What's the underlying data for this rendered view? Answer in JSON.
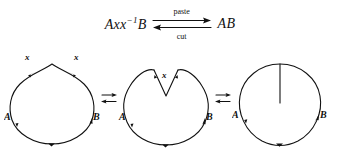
{
  "figure": {
    "caption_formula": {
      "left_expression": "Axx",
      "left_exponent": "−1",
      "left_tail": "B",
      "right_expression": "AB",
      "arrow_top_label": "paste",
      "arrow_bottom_label": "cut",
      "arrow_icon_top": "rightwards-arrow",
      "arrow_icon_bottom": "leftwards-arrow"
    },
    "connectors": [
      {
        "name": "connector-1",
        "glyph": "⇄",
        "icon": "rightleftarrows-icon"
      },
      {
        "name": "connector-2",
        "glyph": "⇄",
        "icon": "rightleftarrows-icon"
      }
    ],
    "diagrams": [
      {
        "id": "loop-with-spike-labels",
        "labels": {
          "left_vertex": "A",
          "right_vertex": "B",
          "edge_left": "x",
          "edge_right": "x"
        }
      },
      {
        "id": "loop-with-notch",
        "labels": {
          "left_vertex": "A",
          "right_vertex": "B",
          "notch": "x"
        }
      },
      {
        "id": "circle-with-slit",
        "labels": {
          "left_vertex": "A",
          "right_vertex": "B"
        }
      }
    ],
    "colors": {
      "background": "#ffffff",
      "ink": "#111111"
    }
  }
}
